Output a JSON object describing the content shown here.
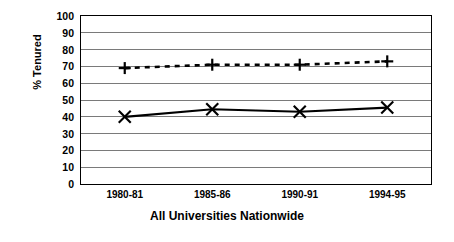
{
  "chart_data": {
    "type": "line",
    "title": "",
    "xlabel": "All Universities Nationwide",
    "ylabel": "% Tenured",
    "categories": [
      "1980-81",
      "1985-86",
      "1990-91",
      "1994-95"
    ],
    "ylim": [
      0,
      100
    ],
    "ytick_step": 10,
    "yticks": [
      "100",
      "90",
      "80",
      "70",
      "60",
      "50",
      "40",
      "30",
      "20",
      "10",
      "0"
    ],
    "grid": "horizontal",
    "legend": "none",
    "series": [
      {
        "name": "series-dashed-plus",
        "marker": "plus",
        "linestyle": "dashed",
        "color": "#000000",
        "values": [
          69,
          71,
          71,
          73
        ]
      },
      {
        "name": "series-solid-cross",
        "marker": "cross",
        "linestyle": "solid",
        "color": "#000000",
        "values": [
          40,
          44.5,
          43,
          45.5
        ]
      }
    ]
  },
  "axis": {
    "y_title": "% Tenured",
    "x_title": "All Universities Nationwide"
  }
}
